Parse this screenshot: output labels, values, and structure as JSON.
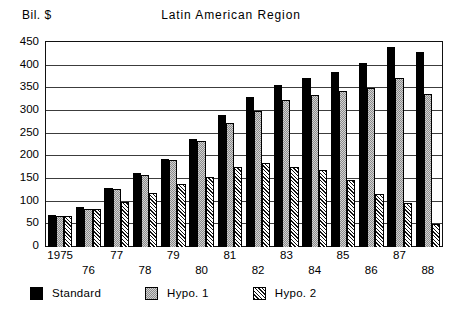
{
  "header": {
    "unit_label": "Bil. $",
    "title": "Latin American Region"
  },
  "chart_data": {
    "type": "bar",
    "title": "Latin American Region",
    "xlabel": "",
    "ylabel": "Bil. $",
    "ylim": [
      0,
      450
    ],
    "yticks": [
      0,
      50,
      100,
      150,
      200,
      250,
      300,
      350,
      400,
      450
    ],
    "ytick_labels": [
      "0",
      "50",
      "100",
      "150",
      "200",
      "250",
      "300",
      "350",
      "400",
      "450"
    ],
    "grid": true,
    "legend_position": "below-axes",
    "categories": [
      "1975",
      "76",
      "77",
      "78",
      "79",
      "80",
      "81",
      "82",
      "83",
      "84",
      "85",
      "86",
      "87",
      "88"
    ],
    "series": [
      {
        "name": "Standard",
        "color": "#000000",
        "pattern": "solid-black",
        "values": [
          70,
          88,
          130,
          163,
          196,
          240,
          293,
          332,
          360,
          375,
          388,
          408,
          443,
          432
        ]
      },
      {
        "name": "Hypo. 1",
        "color": "#d2d2d2",
        "pattern": "fine-stipple",
        "values": [
          69,
          85,
          128,
          159,
          192,
          235,
          276,
          302,
          325,
          338,
          346,
          352,
          375,
          340
        ]
      },
      {
        "name": "Hypo. 2",
        "color": "#ffffff",
        "pattern": "diagonal-hatch",
        "values": [
          69,
          84,
          100,
          120,
          139,
          155,
          178,
          187,
          178,
          170,
          148,
          118,
          97,
          52
        ]
      }
    ]
  },
  "legend": {
    "items": [
      {
        "label": "Standard",
        "swatch": "standard"
      },
      {
        "label": "Hypo. 1",
        "swatch": "hypo1"
      },
      {
        "label": "Hypo. 2",
        "swatch": "hypo2"
      }
    ]
  }
}
